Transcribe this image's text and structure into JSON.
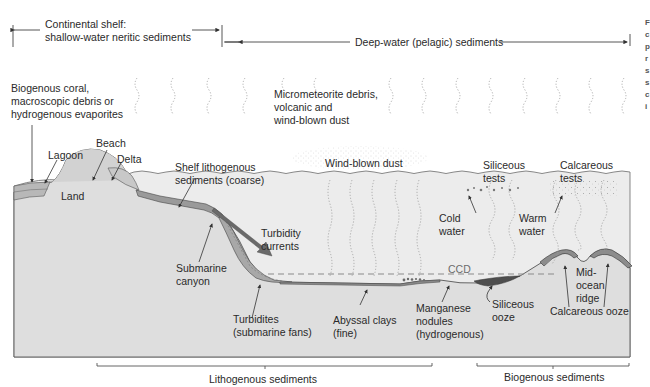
{
  "diagram": {
    "colors": {
      "background": "#ffffff",
      "ocean_water": "#eaeaea",
      "crust": "#dedede",
      "land": "#d8d8d8",
      "sediment_light": "#bdbdbd",
      "sediment_dark": "#7a7a7a",
      "siliceous_ooze": "#555555",
      "calcareous_ooze": "#9a9a9a",
      "line": "#444444",
      "ccd_line": "#8a8a8a",
      "turbidity_arrow": "#6a6a6a"
    },
    "zones": {
      "continental_shelf": {
        "line1": "Continental shelf:",
        "line2": "shallow-water neritic sediments"
      },
      "deep_water": {
        "label": "Deep-water (pelagic) sediments"
      }
    },
    "atmosphere_labels": {
      "biogenous_coral": [
        "Biogenous coral,",
        "macroscopic debris or",
        "hydrogenous evaporites"
      ],
      "micrometeorite": [
        "Micrometeorite debris,",
        "volcanic and",
        "wind-blown dust"
      ],
      "wind_blown_dust": "Wind-blown dust"
    },
    "coastal_labels": {
      "lagoon": "Lagoon",
      "beach": "Beach",
      "delta": "Delta",
      "land": "Land",
      "shelf_lithogenous": [
        "Shelf lithogenous",
        "sediments (coarse)"
      ]
    },
    "slope_labels": {
      "turbidity_currents": [
        "Turbidity",
        "currents"
      ],
      "submarine_canyon": [
        "Submarine",
        "canyon"
      ],
      "turbidites": [
        "Turbidites",
        "(submarine fans)"
      ]
    },
    "deep_labels": {
      "abyssal_clays": [
        "Abyssal clays",
        "(fine)"
      ],
      "manganese_nodules": [
        "Manganese",
        "nodules",
        "(hydrogenous)"
      ],
      "ccd": "CCD",
      "siliceous_ooze": [
        "Siliceous",
        "ooze"
      ],
      "calcareous_ooze": "Calcareous ooze",
      "mid_ocean_ridge": [
        "Mid-",
        "ocean",
        "ridge"
      ]
    },
    "surface_labels": {
      "siliceous_tests": [
        "Siliceous",
        "tests"
      ],
      "calcareous_tests": [
        "Calcareous",
        "tests"
      ],
      "cold_water": [
        "Cold",
        "water"
      ],
      "warm_water": [
        "Warm",
        "water"
      ]
    },
    "bottom_brackets": {
      "lithogenous": "Lithogenous sediments",
      "biogenous": "Biogenous sediments"
    },
    "cropped_side_text": [
      "F",
      "c",
      "p",
      "r",
      "s",
      "s",
      "c",
      "i"
    ]
  }
}
